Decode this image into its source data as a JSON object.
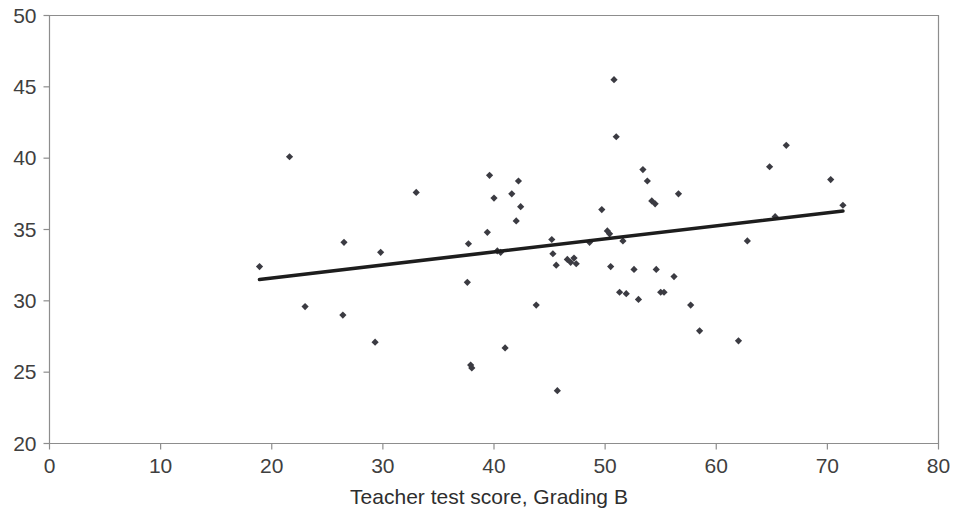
{
  "chart_data": {
    "type": "scatter",
    "title": "",
    "xlabel": "Teacher test score, Grading B",
    "ylabel": "",
    "xlim": [
      0,
      80
    ],
    "ylim": [
      20,
      50
    ],
    "xticks": [
      0,
      10,
      20,
      30,
      40,
      50,
      60,
      70,
      80
    ],
    "yticks": [
      20,
      25,
      30,
      35,
      40,
      45,
      50
    ],
    "xtick_labels": [
      "0",
      "10",
      "20",
      "30",
      "40",
      "50",
      "60",
      "70",
      "80"
    ],
    "ytick_labels": [
      "20",
      "25",
      "30",
      "35",
      "40",
      "45",
      "50"
    ],
    "grid": false,
    "legend": false,
    "legend_position": "none",
    "marker_color": "#3b3b42",
    "trendline_color": "#1d1d1d",
    "frame_color": "#8d8d8d",
    "series": [
      {
        "name": "Observations",
        "marker": "diamond",
        "points": [
          [
            18.9,
            32.4
          ],
          [
            21.6,
            40.1
          ],
          [
            23.0,
            29.6
          ],
          [
            26.4,
            29.0
          ],
          [
            26.5,
            34.1
          ],
          [
            29.3,
            27.1
          ],
          [
            29.8,
            33.4
          ],
          [
            33.0,
            37.6
          ],
          [
            37.6,
            31.3
          ],
          [
            37.7,
            34.0
          ],
          [
            37.9,
            25.5
          ],
          [
            38.0,
            25.3
          ],
          [
            39.4,
            34.8
          ],
          [
            39.6,
            38.8
          ],
          [
            40.0,
            37.2
          ],
          [
            40.3,
            33.5
          ],
          [
            40.6,
            33.4
          ],
          [
            41.0,
            26.7
          ],
          [
            41.6,
            37.5
          ],
          [
            42.0,
            35.6
          ],
          [
            42.2,
            38.4
          ],
          [
            42.4,
            36.6
          ],
          [
            43.8,
            29.7
          ],
          [
            45.2,
            34.3
          ],
          [
            45.3,
            33.3
          ],
          [
            45.6,
            32.5
          ],
          [
            45.7,
            23.7
          ],
          [
            46.6,
            32.9
          ],
          [
            46.9,
            32.7
          ],
          [
            47.2,
            33.0
          ],
          [
            47.4,
            32.6
          ],
          [
            48.6,
            34.1
          ],
          [
            49.7,
            36.4
          ],
          [
            50.2,
            34.9
          ],
          [
            50.4,
            34.7
          ],
          [
            50.5,
            32.4
          ],
          [
            50.8,
            45.5
          ],
          [
            51.0,
            41.5
          ],
          [
            51.3,
            30.6
          ],
          [
            51.6,
            34.2
          ],
          [
            51.9,
            30.5
          ],
          [
            52.6,
            32.2
          ],
          [
            53.0,
            30.1
          ],
          [
            53.4,
            39.2
          ],
          [
            53.8,
            38.4
          ],
          [
            54.2,
            37.0
          ],
          [
            54.5,
            36.8
          ],
          [
            54.6,
            32.2
          ],
          [
            55.0,
            30.6
          ],
          [
            55.3,
            30.6
          ],
          [
            56.2,
            31.7
          ],
          [
            56.6,
            37.5
          ],
          [
            57.7,
            29.7
          ],
          [
            58.5,
            27.9
          ],
          [
            62.0,
            27.2
          ],
          [
            62.8,
            34.2
          ],
          [
            64.8,
            39.4
          ],
          [
            65.3,
            35.9
          ],
          [
            66.3,
            40.9
          ],
          [
            70.3,
            38.5
          ],
          [
            71.4,
            36.7
          ]
        ]
      }
    ],
    "trendline": {
      "name": "Linear fit",
      "x_start": 18.9,
      "y_start": 31.5,
      "x_end": 71.4,
      "y_end": 36.3
    }
  }
}
